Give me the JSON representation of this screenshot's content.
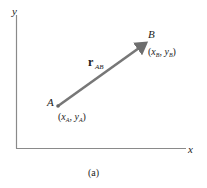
{
  "figure": {
    "caption": "(a)",
    "axes": {
      "x_label": "x",
      "y_label": "y",
      "color": "#8a8a8a"
    },
    "vector": {
      "name": "r",
      "subscript": "AB",
      "color": "#7a7a7a",
      "start": {
        "label": "A",
        "coord_open": "(",
        "coord_x": "x",
        "coord_x_sub": "A",
        "sep": ", ",
        "coord_y": "y",
        "coord_y_sub": "A",
        "coord_close": ")"
      },
      "end": {
        "label": "B",
        "coord_open": "(",
        "coord_x": "x",
        "coord_x_sub": "B",
        "sep": ", ",
        "coord_y": "y",
        "coord_y_sub": "B",
        "coord_close": ")"
      }
    }
  }
}
